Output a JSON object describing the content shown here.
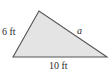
{
  "diagram": {
    "type": "triangle",
    "fill_color": "#e4e4e4",
    "stroke_color": "#555555",
    "vertices": {
      "top": [
        39,
        11
      ],
      "bottom_left": [
        13,
        57
      ],
      "bottom_right": [
        107,
        57
      ]
    },
    "labels": {
      "left_side": "6 ft",
      "right_side": "a",
      "base": "10 ft"
    }
  }
}
